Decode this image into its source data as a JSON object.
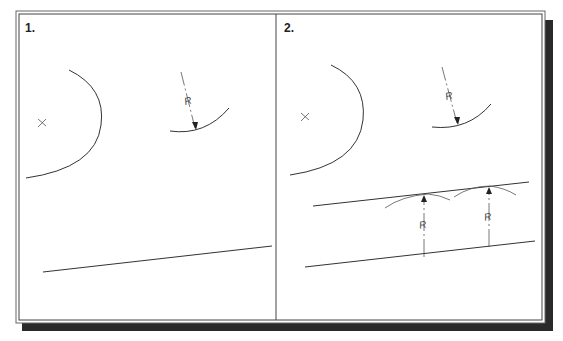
{
  "figure": {
    "colors": {
      "line": "#333333",
      "shadow": "#2a2a2a",
      "frame": "#555555",
      "background": "#ffffff"
    },
    "panels": [
      {
        "label": "1.",
        "elements": [
          "center-mark",
          "circle-arc",
          "radius-arc-with-R-dimension",
          "inclined-line"
        ],
        "radius_label": "R"
      },
      {
        "label": "2.",
        "elements": [
          "center-mark",
          "circle-arc",
          "radius-arc-with-R-dimension",
          "offset-line",
          "inclined-line",
          "R-dimension-1",
          "R-dimension-2"
        ],
        "radius_label": "R",
        "dimension_labels": [
          "R",
          "R"
        ]
      }
    ]
  }
}
